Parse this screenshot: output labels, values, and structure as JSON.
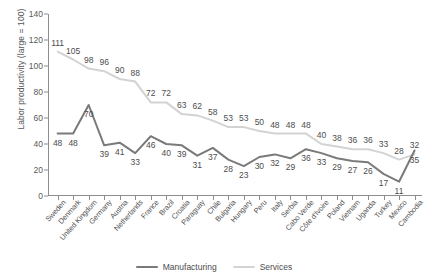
{
  "chart_data": {
    "type": "line",
    "title": "",
    "subtitle": "",
    "xlabel": "",
    "ylabel": "Labor productivity (large = 100)",
    "ylim": [
      0,
      140
    ],
    "ytick_step": 20,
    "yticks": [
      "0",
      "20",
      "40",
      "60",
      "80",
      "100",
      "120",
      "140"
    ],
    "grid": false,
    "legend_position": "bottom-center",
    "categories": [
      "Sweden",
      "Denmark",
      "United Kingdom",
      "Germany",
      "Austria",
      "Netherlands",
      "France",
      "Brazil",
      "Croatia",
      "Paraguay",
      "Chile",
      "Bulgaria",
      "Hungary",
      "Peru",
      "Italy",
      "Serbia",
      "Cabo Verde",
      "Côte d'Ivoire",
      "Poland",
      "Vietnam",
      "Uganda",
      "Turkey",
      "Mexico",
      "Cambodia"
    ],
    "series": [
      {
        "name": "Manufacturing",
        "color": "#7a7a7a",
        "label_position": "below",
        "values": [
          48,
          48,
          70,
          39,
          41,
          33,
          46,
          40,
          39,
          31,
          37,
          28,
          23,
          30,
          32,
          29,
          36,
          33,
          29,
          27,
          26,
          17,
          11,
          35
        ]
      },
      {
        "name": "Services",
        "color": "#d3d3d3",
        "label_position": "above",
        "values": [
          111,
          105,
          98,
          96,
          90,
          88,
          72,
          72,
          63,
          62,
          58,
          53,
          53,
          50,
          48,
          48,
          48,
          40,
          38,
          36,
          36,
          33,
          28,
          32
        ]
      }
    ]
  },
  "legend": {
    "items": [
      {
        "label": "Manufacturing",
        "color": "#7a7a7a"
      },
      {
        "label": "Services",
        "color": "#d3d3d3"
      }
    ]
  }
}
